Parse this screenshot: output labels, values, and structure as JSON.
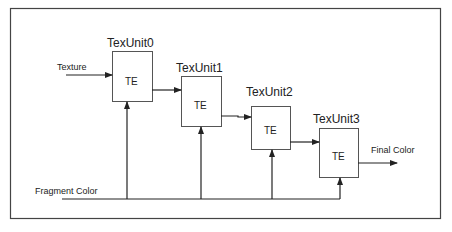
{
  "diagram": {
    "units": [
      {
        "title": "TexUnit0",
        "body": "TE"
      },
      {
        "title": "TexUnit1",
        "body": "TE"
      },
      {
        "title": "TexUnit2",
        "body": "TE"
      },
      {
        "title": "TexUnit3",
        "body": "TE"
      }
    ],
    "inputs": {
      "texture": "Texture",
      "fragment_color": "Fragment Color"
    },
    "output": "Final Color",
    "colors": {
      "stroke": "#333333",
      "text": "#222222",
      "background": "#ffffff"
    }
  }
}
